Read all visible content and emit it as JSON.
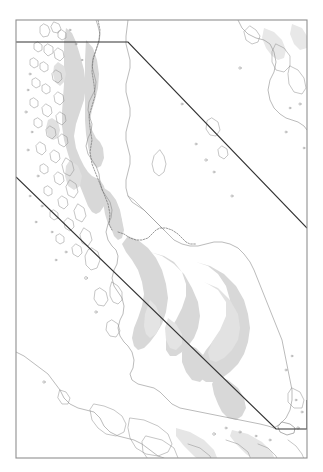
{
  "figure": {
    "caption": "",
    "domain": "map",
    "width": 323,
    "height": 472
  },
  "map": {
    "title": "",
    "region_name": "Malay Peninsula",
    "projection_note": "",
    "colors": {
      "background": "#ffffff",
      "land_shading": "#d6d6d6",
      "land_shading_light": "#e6e6e6",
      "coastline": "#8a8a8a",
      "country_border": "#6e6e6e",
      "study_area_outline": "#3a3a3a",
      "frame": "#8f8f8f"
    },
    "frame": {
      "left": 16,
      "top": 20,
      "right": 307,
      "bottom": 458
    },
    "layers": [
      {
        "name": "coastline",
        "label": "Coastline",
        "visible": true
      },
      {
        "name": "elevation-shading",
        "label": "Elevation shading",
        "visible": true
      },
      {
        "name": "country-border",
        "label": "International border",
        "visible": true
      },
      {
        "name": "study-area-outline",
        "label": "Study area outline",
        "visible": true
      }
    ],
    "study_area": {
      "name": "study-area-boundary",
      "upper_segment": [
        [
          16,
          42
        ],
        [
          128,
          42
        ],
        [
          307,
          228
        ]
      ],
      "lower_segment": [
        [
          16,
          177
        ],
        [
          276,
          429
        ],
        [
          307,
          429
        ],
        [
          307,
          400
        ]
      ]
    },
    "features": [
      {
        "name": "mergui-archipelago",
        "type": "islands"
      },
      {
        "name": "malay-peninsula",
        "type": "landmass"
      },
      {
        "name": "gulf-of-thailand",
        "type": "water"
      },
      {
        "name": "andaman-sea",
        "type": "water"
      },
      {
        "name": "straits-of-malacca",
        "type": "water"
      },
      {
        "name": "singapore",
        "type": "island"
      },
      {
        "name": "sumatra-coast",
        "type": "landmass"
      },
      {
        "name": "riau-islands",
        "type": "islands"
      },
      {
        "name": "langkawi",
        "type": "island"
      },
      {
        "name": "penang",
        "type": "island"
      },
      {
        "name": "phuket",
        "type": "island"
      }
    ],
    "scale_bar": {
      "visible": false,
      "label": ""
    },
    "north_arrow": {
      "visible": false,
      "label": ""
    },
    "legend": {
      "visible": false,
      "entries": []
    }
  }
}
